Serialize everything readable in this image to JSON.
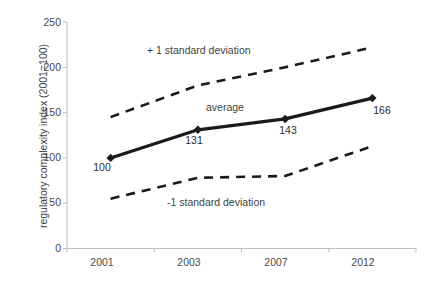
{
  "chart_data": {
    "type": "line",
    "title": "",
    "xlabel": "",
    "ylabel": "regulatory complexity index (2001=100)",
    "categories": [
      "2001",
      "2003",
      "2007",
      "2012"
    ],
    "ylim": [
      0,
      250
    ],
    "yticks": [
      0,
      50,
      100,
      150,
      200,
      250
    ],
    "ytick_labels": [
      "0",
      "50",
      "100",
      "150",
      "200",
      "250"
    ],
    "grid": false,
    "legend": "none",
    "series": [
      {
        "name": "+ 1 standard deviation",
        "style": "dashed",
        "color": "#1a1a1a",
        "values": [
          145,
          180,
          200,
          222
        ],
        "marker": "none"
      },
      {
        "name": "average",
        "style": "solid",
        "color": "#1a1a1a",
        "values": [
          100,
          131,
          143,
          166
        ],
        "marker": "diamond",
        "data_labels": [
          "100",
          "131",
          "143",
          "166"
        ]
      },
      {
        "name": "-1 standard deviation",
        "style": "dashed",
        "color": "#1a1a1a",
        "values": [
          55,
          78,
          80,
          113
        ],
        "marker": "none"
      }
    ],
    "annotations": [
      {
        "text": "+ 1 standard deviation",
        "x": "2002",
        "y": 228
      },
      {
        "text": "average",
        "x": "2004",
        "y": 152
      },
      {
        "text": "-1 standard deviation",
        "x": "2006",
        "y": 48
      }
    ],
    "axis_color": "#bfbfbf",
    "text_color": "#3f3f3f",
    "background": "#ffffff"
  },
  "annotations": {
    "plus_one_sd": "+ 1 standard deviation",
    "average": "average",
    "minus_one_sd": "-1 standard deviation"
  },
  "point_labels": {
    "p0": "100",
    "p1": "131",
    "p2": "143",
    "p3": "166"
  },
  "y_ticks": {
    "t0": "0",
    "t50": "50",
    "t100": "100",
    "t150": "150",
    "t200": "200",
    "t250": "250"
  },
  "x_ticks": {
    "c0": "2001",
    "c1": "2003",
    "c2": "2007",
    "c3": "2012"
  },
  "axis_titles": {
    "y": "regulatory complexity index (2001=100)"
  }
}
